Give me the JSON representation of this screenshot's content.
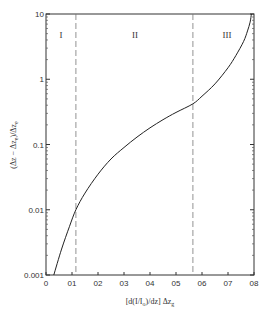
{
  "chart_data": {
    "type": "line",
    "title": "",
    "xlabel": "[d(I/I_o)/dz] Δz_g",
    "ylabel": "(Δz − Δz_e)/Δz_e",
    "xlim": [
      0,
      0.8
    ],
    "ylim": [
      0.001,
      10
    ],
    "yscale": "log",
    "grid": false,
    "legend": null,
    "x_ticks": [
      "0",
      "01",
      "02",
      "03",
      "04",
      "05",
      "06",
      "07",
      "08"
    ],
    "y_ticks": [
      "0.001",
      "0.01",
      "0.1",
      "1",
      "10"
    ],
    "series": [
      {
        "name": "curve",
        "x": [
          0.03,
          0.06,
          0.09,
          0.115,
          0.15,
          0.2,
          0.25,
          0.3,
          0.35,
          0.4,
          0.45,
          0.5,
          0.565,
          0.6,
          0.65,
          0.7,
          0.73,
          0.76,
          0.775,
          0.785,
          0.79
        ],
        "y": [
          0.001,
          0.0025,
          0.0055,
          0.01,
          0.018,
          0.035,
          0.06,
          0.09,
          0.13,
          0.18,
          0.24,
          0.31,
          0.42,
          0.55,
          0.85,
          1.5,
          2.3,
          3.8,
          5.5,
          7.5,
          10
        ]
      }
    ],
    "annotations": [
      {
        "type": "vline",
        "x": 0.115,
        "style": "dashed"
      },
      {
        "type": "vline",
        "x": 0.565,
        "style": "dashed"
      },
      {
        "type": "text",
        "text": "I",
        "x": 0.06,
        "y": 3.5
      },
      {
        "type": "text",
        "text": "II",
        "x": 0.34,
        "y": 3.5
      },
      {
        "type": "text",
        "text": "III",
        "x": 0.69,
        "y": 3.5
      }
    ]
  },
  "labels": {
    "xlabel_main": "[d(I/I",
    "xlabel_sub0": "o",
    "xlabel_mid": ")/dz] Δz",
    "xlabel_sub1": "g",
    "ylabel_main": "(Δz − Δz",
    "ylabel_sub0": "e",
    "ylabel_mid": ")/Δz",
    "ylabel_sub1": "e",
    "region_1": "I",
    "region_2": "II",
    "region_3": "III"
  }
}
